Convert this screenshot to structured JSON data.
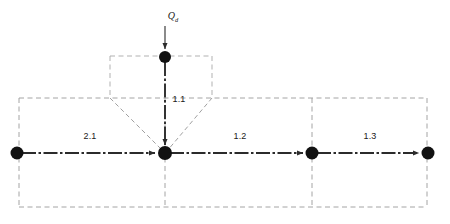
{
  "diagram": {
    "colors": {
      "node_fill": "#111111",
      "flow_line": "#2b2b2b",
      "zone_boundary": "#9a9a9a",
      "funnel_boundary": "#a8a8a8",
      "background": "#ffffff",
      "text": "#1a1a1a"
    },
    "source": {
      "symbol": "Q",
      "subscript": "d",
      "label": "Qd",
      "description": "external inflow arrow into top node"
    },
    "nodes": [
      {
        "id": "n-top",
        "name": "top-node",
        "x": 165,
        "y": 57,
        "r": 6
      },
      {
        "id": "n-left",
        "name": "left-node",
        "x": 17,
        "y": 153,
        "r": 6.5
      },
      {
        "id": "n-center",
        "name": "junction-node",
        "x": 165,
        "y": 153,
        "r": 7
      },
      {
        "id": "n-midright",
        "name": "mid-right-node",
        "x": 312,
        "y": 153,
        "r": 6.5
      },
      {
        "id": "n-right",
        "name": "right-node",
        "x": 428,
        "y": 153,
        "r": 6.5
      }
    ],
    "flows": [
      {
        "id": "f-2-1",
        "label": "2.1",
        "label_x": 90,
        "label_y": 136,
        "from": "n-left",
        "to": "n-center",
        "orientation": "horizontal"
      },
      {
        "id": "f-1-1",
        "label": "1.1",
        "label_x": 179,
        "label_y": 99,
        "from": "n-top",
        "to": "n-center",
        "orientation": "vertical"
      },
      {
        "id": "f-1-2",
        "label": "1.2",
        "label_x": 240,
        "label_y": 136,
        "from": "n-center",
        "to": "n-midright",
        "orientation": "horizontal"
      },
      {
        "id": "f-1-3",
        "label": "1.3",
        "label_x": 370,
        "label_y": 136,
        "from": "n-midright",
        "to": "n-right",
        "orientation": "horizontal"
      }
    ],
    "zones": {
      "outer_rect": {
        "left": 19,
        "top": 98,
        "right": 427,
        "bottom": 207
      },
      "dividers_x": [
        165,
        312
      ],
      "funnel": {
        "top_y": 56,
        "shoulder_y": 98,
        "left_x": 110,
        "right_x": 212,
        "apex_x": 165,
        "apex_y": 153
      }
    }
  }
}
